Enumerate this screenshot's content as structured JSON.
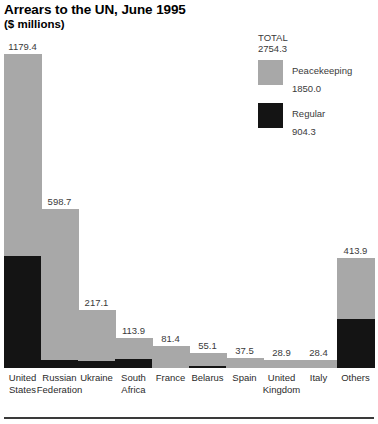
{
  "header": {
    "title": "Arrears to the UN, June 1995",
    "subtitle": "($ millions)"
  },
  "legend": {
    "total_label": "TOTAL",
    "total_value": "2754.3",
    "items": [
      {
        "name": "Peacekeeping",
        "value": "1850.0",
        "color": "#a8a8a8",
        "swatch_icon": "legend-swatch-peacekeeping"
      },
      {
        "name": "Regular",
        "value": "904.3",
        "color": "#141414",
        "swatch_icon": "legend-swatch-regular"
      }
    ]
  },
  "chart_data": {
    "type": "bar",
    "title": "Arrears to the UN, June 1995",
    "subtitle": "($ millions)",
    "xlabel": "",
    "ylabel": "$ millions",
    "stacked": true,
    "grid": false,
    "legend_position": "top-right",
    "ylim": [
      0,
      1200
    ],
    "categories": [
      "United States",
      "Russian Federation",
      "Ukraine",
      "South Africa",
      "France",
      "Belarus",
      "Spain",
      "United Kingdom",
      "Italy",
      "Others"
    ],
    "series": [
      {
        "name": "Peacekeeping",
        "color": "#a8a8a8",
        "values": [
          758.6,
          567.0,
          191.8,
          80.0,
          81.4,
          50.3,
          37.5,
          28.9,
          28.4,
          228.9
        ]
      },
      {
        "name": "Regular",
        "color": "#141414",
        "values": [
          420.8,
          31.7,
          25.3,
          33.9,
          0.0,
          4.8,
          0.0,
          0.0,
          0.0,
          185.0
        ]
      }
    ],
    "totals": [
      1179.4,
      598.7,
      217.1,
      113.9,
      81.4,
      55.1,
      37.5,
      28.9,
      28.4,
      413.9
    ],
    "data_labels": [
      "1179.4",
      "598.7",
      "217.1",
      "113.9",
      "81.4",
      "55.1",
      "37.5",
      "28.9",
      "28.4",
      "413.9"
    ],
    "grand_total": 2754.3,
    "totals_by_series": {
      "Peacekeeping": 1850.0,
      "Regular": 904.3
    }
  },
  "bars": [
    {
      "label_line1": "United",
      "label_line2": "States",
      "value": "1179.4",
      "left": 19,
      "width": 38,
      "gray_h": 234,
      "black_h": 130
    },
    {
      "label_line1": "Russian",
      "label_line2": "Federation",
      "value": "598.7",
      "left": 64,
      "width": 38,
      "gray_h": 175,
      "black_h": 10
    },
    {
      "label_line1": "Ukraine",
      "label_line2": "",
      "value": "217.1",
      "left": 109,
      "width": 38,
      "gray_h": 52,
      "black_h": 15
    },
    {
      "label_line1": "South",
      "label_line2": "Africa",
      "value": "113.9",
      "left": 154,
      "width": 38,
      "gray_h": 21,
      "black_h": 14
    },
    {
      "label_line1": "France",
      "label_line2": "",
      "value": "81.4",
      "left": 199,
      "width": 38,
      "gray_h": 25,
      "black_h": 0
    },
    {
      "label_line1": "Belarus",
      "label_line2": "",
      "value": "55.1",
      "left": 244,
      "width": 38,
      "gray_h": 14,
      "black_h": 3
    },
    {
      "label_line1": "Spain",
      "label_line2": "",
      "value": "37.5",
      "left": 289,
      "width": 38,
      "gray_h": 12,
      "black_h": 0
    },
    {
      "label_line1": "United",
      "label_line2": "Kingdom",
      "value": "28.9",
      "left": 334,
      "width": 38,
      "gray_h": 9,
      "black_h": 0
    },
    {
      "label_line1": "Italy",
      "label_line2": "",
      "value": "28.4",
      "left": 379,
      "width": 38,
      "gray_h": 9,
      "black_h": 0
    },
    {
      "label_line1": "Others",
      "label_line2": "",
      "value": "413.9",
      "left": 424,
      "width": 38,
      "gray_h": 52,
      "black_h": 43
    }
  ]
}
